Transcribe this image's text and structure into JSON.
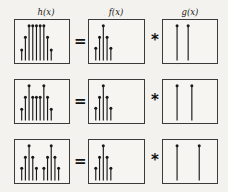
{
  "figure": {
    "type": "diagram",
    "background_color": "#f4f2ee",
    "ink_color": "#1a1a1a"
  },
  "columns": [
    {
      "id": "h",
      "label": "h(x)",
      "x_center": 46,
      "y": 8
    },
    {
      "id": "f",
      "label": "f(x)",
      "x_center": 116,
      "y": 8
    },
    {
      "id": "g",
      "label": "g(x)",
      "x_center": 190,
      "y": 8
    }
  ],
  "operators": {
    "equals": "=",
    "convolution": "*"
  },
  "geometry": {
    "panel_h": {
      "x": 14,
      "w": 56
    },
    "panel_f": {
      "x": 88,
      "w": 57
    },
    "panel_g": {
      "x": 162,
      "w": 56
    },
    "op_eq_x": 74,
    "op_conv_x": 149,
    "rows_y": [
      19,
      79,
      139
    ],
    "row_h": 45
  },
  "chart_data": [
    {
      "id": "row1-h",
      "type": "stem",
      "title": "h(x)",
      "row": 1,
      "column": "h",
      "grid": false,
      "xlim": [
        0,
        13
      ],
      "ylim": [
        0,
        1
      ],
      "x": [
        1,
        2,
        3,
        4,
        5,
        6,
        7,
        8,
        9,
        10
      ],
      "values": [
        0.28,
        0.62,
        0.93,
        0.93,
        0.93,
        0.93,
        0.93,
        0.62,
        0.28,
        0.0
      ],
      "annotation": "two copies of f(x) fully overlapping -> flat plateau"
    },
    {
      "id": "row1-f",
      "type": "stem",
      "title": "f(x)",
      "row": 1,
      "column": "f",
      "grid": false,
      "xlim": [
        0,
        13
      ],
      "ylim": [
        0,
        1
      ],
      "x": [
        1,
        2,
        3,
        4,
        5
      ],
      "values": [
        0.33,
        0.62,
        0.93,
        0.62,
        0.33
      ],
      "annotation": "fixed 5-tap triangular pulse"
    },
    {
      "id": "row1-g",
      "type": "stem",
      "title": "g(x)",
      "row": 1,
      "column": "g",
      "grid": false,
      "xlim": [
        0,
        13
      ],
      "ylim": [
        0,
        1
      ],
      "x": [
        3,
        6
      ],
      "values": [
        0.93,
        0.93
      ],
      "annotation": "two impulses, narrow separation"
    },
    {
      "id": "row2-h",
      "type": "stem",
      "title": "h(x)",
      "row": 2,
      "column": "h",
      "grid": false,
      "xlim": [
        0,
        13
      ],
      "ylim": [
        0,
        1
      ],
      "x": [
        1,
        2,
        3,
        4,
        5,
        6,
        7,
        8,
        9,
        10
      ],
      "values": [
        0.3,
        0.62,
        0.93,
        0.62,
        0.62,
        0.62,
        0.93,
        0.62,
        0.3,
        0.0
      ],
      "annotation": "two copies of f(x) partially overlapping -> twin peaks"
    },
    {
      "id": "row2-f",
      "type": "stem",
      "title": "f(x)",
      "row": 2,
      "column": "f",
      "grid": false,
      "xlim": [
        0,
        13
      ],
      "ylim": [
        0,
        1
      ],
      "x": [
        1,
        2,
        3,
        4,
        5
      ],
      "values": [
        0.33,
        0.62,
        0.93,
        0.62,
        0.33
      ],
      "annotation": "fixed 5-tap triangular pulse"
    },
    {
      "id": "row2-g",
      "type": "stem",
      "title": "g(x)",
      "row": 2,
      "column": "g",
      "grid": false,
      "xlim": [
        0,
        13
      ],
      "ylim": [
        0,
        1
      ],
      "x": [
        3,
        7
      ],
      "values": [
        0.93,
        0.93
      ],
      "annotation": "two impulses, medium separation"
    },
    {
      "id": "row3-h",
      "type": "stem",
      "title": "h(x)",
      "row": 3,
      "column": "h",
      "grid": false,
      "xlim": [
        0,
        13
      ],
      "ylim": [
        0,
        1
      ],
      "x": [
        1,
        2,
        3,
        4,
        5,
        7,
        8,
        9,
        10,
        11
      ],
      "values": [
        0.33,
        0.62,
        0.93,
        0.62,
        0.33,
        0.33,
        0.62,
        0.93,
        0.62,
        0.33
      ],
      "annotation": "two copies of f(x) fully separated"
    },
    {
      "id": "row3-f",
      "type": "stem",
      "title": "f(x)",
      "row": 3,
      "column": "f",
      "grid": false,
      "xlim": [
        0,
        13
      ],
      "ylim": [
        0,
        1
      ],
      "x": [
        1,
        2,
        3,
        4,
        5
      ],
      "values": [
        0.33,
        0.62,
        0.93,
        0.62,
        0.33
      ],
      "annotation": "fixed 5-tap triangular pulse"
    },
    {
      "id": "row3-g",
      "type": "stem",
      "title": "g(x)",
      "row": 3,
      "column": "g",
      "grid": false,
      "xlim": [
        0,
        13
      ],
      "ylim": [
        0,
        1
      ],
      "x": [
        3,
        9
      ],
      "values": [
        0.93,
        0.93
      ],
      "annotation": "two impulses, wide separation"
    }
  ]
}
